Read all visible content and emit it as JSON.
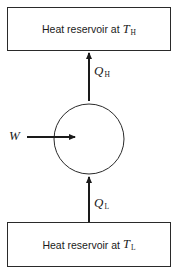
{
  "diagram": {
    "type": "heat-pump-schematic",
    "top_reservoir": {
      "label": "Heat reservoir at",
      "symbol": "T",
      "subscript": "H"
    },
    "bottom_reservoir": {
      "label": "Heat reservoir at",
      "symbol": "T",
      "subscript": "L"
    },
    "flows": {
      "heat_out": {
        "symbol": "Q",
        "subscript": "H",
        "direction": "up, from device to hot reservoir"
      },
      "heat_in": {
        "symbol": "Q",
        "subscript": "L",
        "direction": "up, from cold reservoir to device"
      },
      "work_in": {
        "symbol": "W",
        "direction": "right, into device"
      }
    },
    "colors": {
      "line": "#2a2a2a",
      "background": "#ffffff"
    }
  }
}
